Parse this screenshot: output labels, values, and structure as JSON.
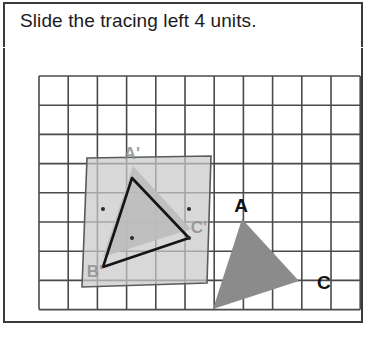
{
  "instruction": "Slide the tracing left 4 units.",
  "colors": {
    "frame_border": "#3a3a3a",
    "grid_line": "#4a4a4a",
    "original_triangle_fill": "#8b8b8b",
    "image_triangle_fill": "#9d9d9d",
    "tracing_paper_fill": "#c9c9c9",
    "tracing_paper_border": "#5a5a5a",
    "outline_stroke": "#141414",
    "label_dark": "#111111",
    "label_faint": "#8f8f8f",
    "background": "#ffffff"
  },
  "grid": {
    "x_start": 36,
    "y_start": 27,
    "spacing": 29.2,
    "columns": 11,
    "rows": 8,
    "line_width": 1.6,
    "visible": true
  },
  "figure": {
    "type": "translation-on-grid",
    "original_triangle": {
      "name": "ABC",
      "fill": "#8b8b8b",
      "vertices": [
        {
          "label": "A",
          "x": 239,
          "y": 170
        },
        {
          "label": "B",
          "x": 210,
          "y": 260
        },
        {
          "label": "C",
          "x": 296,
          "y": 232
        }
      ],
      "labels": [
        {
          "text": "A",
          "x": 238,
          "y": 163,
          "anchor": "middle",
          "tone": "dark"
        },
        {
          "text": "B",
          "x": 214,
          "y": 290,
          "anchor": "middle",
          "tone": "dark"
        },
        {
          "text": "C",
          "x": 314,
          "y": 240,
          "anchor": "start",
          "tone": "dark"
        }
      ]
    },
    "image_triangle": {
      "name": "A'B'C'",
      "fill": "#9d9d9d",
      "vertices": [
        {
          "label": "A'",
          "x": 130,
          "y": 117
        },
        {
          "label": "B'",
          "x": 100,
          "y": 208
        },
        {
          "label": "C'",
          "x": 188,
          "y": 180
        }
      ],
      "labels": [
        {
          "text": "A'",
          "x": 129,
          "y": 110,
          "anchor": "middle",
          "tone": "faint"
        },
        {
          "text": "B'",
          "x": 92,
          "y": 228,
          "anchor": "middle",
          "tone": "faint"
        },
        {
          "text": "C'",
          "x": 196,
          "y": 184,
          "anchor": "middle",
          "tone": "faint"
        }
      ]
    },
    "tracing_paper": {
      "label": "tracing overlay",
      "fill": "#c9c9c9",
      "opacity": 0.72,
      "corners": [
        {
          "x": 84,
          "y": 109
        },
        {
          "x": 208,
          "y": 107
        },
        {
          "x": 204,
          "y": 234
        },
        {
          "x": 79,
          "y": 238
        }
      ]
    },
    "traced_outline": {
      "label": "traced triangle outline",
      "stroke": "#141414",
      "stroke_width": 2.6,
      "vertices": [
        {
          "x": 129,
          "y": 129
        },
        {
          "x": 100,
          "y": 218
        },
        {
          "x": 186,
          "y": 189
        }
      ]
    },
    "vertex_dots": [
      {
        "x": 100,
        "y": 160
      },
      {
        "x": 186,
        "y": 160
      },
      {
        "x": 129,
        "y": 189
      },
      {
        "x": 186,
        "y": 189
      }
    ]
  }
}
